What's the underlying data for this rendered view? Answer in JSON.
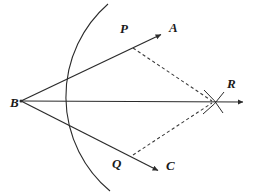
{
  "figure": {
    "background_color": "#ffffff",
    "stroke_color": "#2b2b2b",
    "dashed_color": "#3a3a3a",
    "label_color": "#1a1a1a",
    "width": 257,
    "height": 192
  },
  "labels": {
    "b": "B",
    "p": "P",
    "q": "Q",
    "a": "A",
    "c": "C",
    "r": "R"
  },
  "points": {
    "B": {
      "x": 21,
      "y": 101
    },
    "P": {
      "x": 133,
      "y": 48
    },
    "Q": {
      "x": 133,
      "y": 155
    },
    "R": {
      "x": 213,
      "y": 102
    },
    "A_tip": {
      "x": 163,
      "y": 33
    },
    "C_tip": {
      "x": 160,
      "y": 172
    },
    "BR_tip": {
      "x": 245,
      "y": 102
    }
  },
  "label_positions": {
    "B": {
      "x": 10,
      "y": 107
    },
    "P": {
      "x": 120,
      "y": 33
    },
    "Q": {
      "x": 112,
      "y": 168
    },
    "A": {
      "x": 169,
      "y": 32
    },
    "C": {
      "x": 166,
      "y": 170
    },
    "R": {
      "x": 227,
      "y": 88
    }
  },
  "segments": [
    {
      "name": "ray-BA",
      "from": "B",
      "to": "A_tip",
      "style": "solid",
      "arrow": true
    },
    {
      "name": "ray-BC",
      "from": "B",
      "to": "C_tip",
      "style": "solid",
      "arrow": true
    },
    {
      "name": "ray-BR-bisector",
      "from": "B",
      "to": "BR_tip",
      "style": "solid",
      "arrow": true
    },
    {
      "name": "dashed-PR",
      "from": "P",
      "to": "R",
      "style": "dashed",
      "arrow": false
    },
    {
      "name": "dashed-QR",
      "from": "Q",
      "to": "R",
      "style": "dashed",
      "arrow": false
    }
  ],
  "arcs": {
    "main_arc": {
      "name": "compass-arc-from-B",
      "center": {
        "x": 21,
        "y": 101
      },
      "radius": 123,
      "from": {
        "x": 108,
        "y": 4
      },
      "to": {
        "x": 110,
        "y": 191
      }
    },
    "cross_arc_from_P": {
      "name": "compass-arc-from-P",
      "center": {
        "x": 133,
        "y": 48
      },
      "radius": 92
    },
    "cross_arc_from_Q": {
      "name": "compass-arc-from-Q",
      "center": {
        "x": 133,
        "y": 155
      },
      "radius": 93
    }
  }
}
